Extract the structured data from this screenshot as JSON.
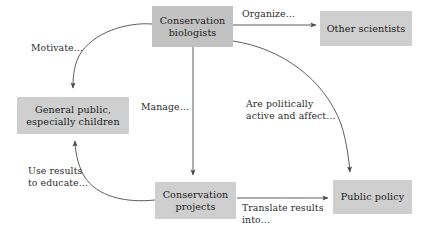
{
  "diagram": {
    "background_color": "#ffffff",
    "node_fill_color": "#cfcfcf",
    "line_color": "#555555",
    "text_color": "#1a1a1a"
  },
  "nodes": [
    {
      "id": "biologists",
      "label": "Conservation\nbiologists"
    },
    {
      "id": "scientists",
      "label": "Other scientists"
    },
    {
      "id": "public",
      "label": "General public,\nespecially children"
    },
    {
      "id": "projects",
      "label": "Conservation\nprojects"
    },
    {
      "id": "policy",
      "label": "Public policy"
    }
  ],
  "edges": [
    {
      "id": "organize",
      "from": "biologists",
      "to": "scientists",
      "label": "Organize…"
    },
    {
      "id": "motivate",
      "from": "biologists",
      "to": "public",
      "label": "Motivate…"
    },
    {
      "id": "manage",
      "from": "biologists",
      "to": "projects",
      "label": "Manage…"
    },
    {
      "id": "political",
      "from": "biologists",
      "to": "policy",
      "label": "Are politically\nactive and affect…"
    },
    {
      "id": "educate",
      "from": "projects",
      "to": "public",
      "label": "Use results\nto educate…"
    },
    {
      "id": "translate",
      "from": "projects",
      "to": "policy",
      "label": "Translate results\ninto…"
    }
  ]
}
